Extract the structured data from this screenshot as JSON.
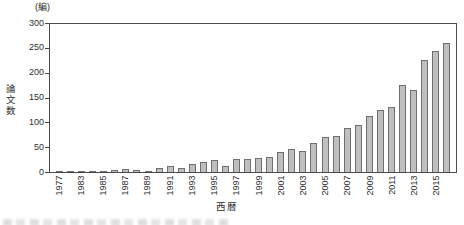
{
  "chart_data": {
    "type": "bar",
    "title": "",
    "unit_label": "(編)",
    "ylabel": "論文数",
    "xlabel": "西暦",
    "ylim": [
      0,
      300
    ],
    "ytick_interval": 50,
    "yticks": [
      300,
      250,
      200,
      150,
      100,
      50,
      0
    ],
    "categories": [
      "1977",
      "",
      "1983",
      "",
      "1985",
      "",
      "1987",
      "",
      "1989",
      "",
      "1991",
      "",
      "1993",
      "",
      "1995",
      "",
      "1997",
      "",
      "1999",
      "",
      "2001",
      "",
      "2003",
      "",
      "2005",
      "",
      "2007",
      "",
      "2009",
      "",
      "2011",
      "",
      "2013",
      "",
      "2015",
      ""
    ],
    "values": [
      2,
      2,
      3,
      3,
      3,
      4,
      6,
      5,
      3,
      9,
      12,
      9,
      16,
      20,
      24,
      12,
      27,
      26,
      29,
      30,
      40,
      46,
      43,
      58,
      70,
      72,
      88,
      94,
      113,
      124,
      131,
      175,
      166,
      225,
      243,
      260
    ],
    "note_unlabeled_ticks": "only every other bar carries a year label; empty strings are unlabeled bars",
    "legend": "none",
    "grid": "off",
    "bar_color": "#bfbfbf",
    "bar_border_color": "#6f6f6f",
    "axis_color": "#4a4a4a",
    "text_color": "#2e2e2e"
  }
}
